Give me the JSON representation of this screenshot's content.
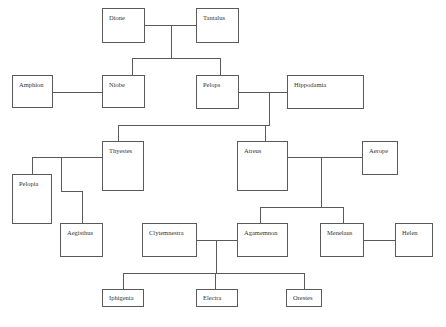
{
  "diagram": {
    "type": "family-tree",
    "nodes": {
      "dione": "Dione",
      "tantalus": "Tantalus",
      "amphion": "Amphion",
      "niobe": "Niobe",
      "pelops": "Pelops",
      "hippodamia": "Hippodamia",
      "thyestes": "Thyestes",
      "atreus": "Atreus",
      "aerope": "Aerope",
      "pelopia": "Pelopia",
      "aegisthus": "Aegisthus",
      "clytemnestra": "Clytemnestra",
      "agamemnon": "Agamemnon",
      "menelaus": "Menelaus",
      "helen": "Helen",
      "iphigenia": "Iphigenia",
      "electra": "Electra",
      "orestes": "Orestes"
    },
    "unions": [
      {
        "partners": [
          "Dione",
          "Tantalus"
        ],
        "children": [
          "Niobe",
          "Pelops"
        ]
      },
      {
        "partners": [
          "Amphion",
          "Niobe"
        ],
        "children": []
      },
      {
        "partners": [
          "Pelops",
          "Hippodamia"
        ],
        "children": [
          "Thyestes",
          "Atreus"
        ]
      },
      {
        "partners": [
          "Thyestes"
        ],
        "children": [
          "Pelopia",
          "Aegisthus"
        ]
      },
      {
        "partners": [
          "Atreus",
          "Aerope"
        ],
        "children": [
          "Agamemnon",
          "Menelaus"
        ]
      },
      {
        "partners": [
          "Clytemnestra",
          "Agamemnon"
        ],
        "children": [
          "Iphigenia",
          "Electra",
          "Orestes"
        ]
      },
      {
        "partners": [
          "Menelaus",
          "Helen"
        ],
        "children": []
      }
    ],
    "colors": {
      "line": "#5a5a5a",
      "box_border": "#5a5a5a",
      "text": "#333333",
      "background": "#ffffff"
    }
  }
}
